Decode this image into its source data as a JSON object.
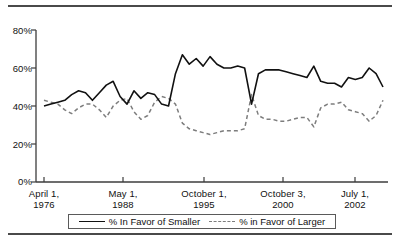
{
  "chart_data": {
    "type": "line",
    "title": "",
    "xlabel": "",
    "ylabel": "",
    "ylim": [
      0,
      80
    ],
    "grid": false,
    "legend_position": "bottom",
    "ytick_labels": [
      "80%",
      "60%",
      "40%",
      "20%",
      "0%"
    ],
    "ytick_values": [
      80,
      60,
      40,
      20,
      0
    ],
    "xtick_labels": [
      {
        "line1": "April 1,",
        "line2": "1976"
      },
      {
        "line1": "May 1,",
        "line2": "1988"
      },
      {
        "line1": "October 1,",
        "line2": "1995"
      },
      {
        "line1": "October 3,",
        "line2": "2000"
      },
      {
        "line1": "July 1,",
        "line2": "2002"
      }
    ],
    "xtick_index": [
      0,
      12,
      25,
      37,
      48
    ],
    "series": [
      {
        "name": "% In Favor of Smaller",
        "style": "solid",
        "color": "#111111",
        "values": [
          40,
          41,
          42,
          43,
          46,
          48,
          47,
          43,
          47,
          51,
          53,
          45,
          41,
          48,
          44,
          47,
          46,
          41,
          40,
          57,
          67,
          62,
          65,
          61,
          66,
          62,
          60,
          60,
          61,
          60,
          41,
          57,
          59,
          59,
          59,
          58,
          57,
          56,
          55,
          61,
          53,
          52,
          52,
          50,
          55,
          54,
          55,
          60,
          57,
          50
        ]
      },
      {
        "name": "% in Favor of Larger",
        "style": "dashed",
        "color": "#7d7d7d",
        "values": [
          43,
          42,
          41,
          38,
          36,
          39,
          41,
          41,
          38,
          34,
          40,
          43,
          44,
          37,
          33,
          35,
          42,
          45,
          44,
          41,
          31,
          28,
          27,
          26,
          25,
          26,
          27,
          27,
          27,
          28,
          46,
          35,
          33,
          33,
          32,
          32,
          33,
          34,
          34,
          29,
          39,
          41,
          41,
          42,
          38,
          37,
          36,
          32,
          35,
          43
        ]
      }
    ]
  },
  "legend": {
    "entries": [
      {
        "label": "% In Favor of Smaller",
        "style": "solid"
      },
      {
        "label": "% in Favor of Larger",
        "style": "dashed"
      }
    ]
  }
}
